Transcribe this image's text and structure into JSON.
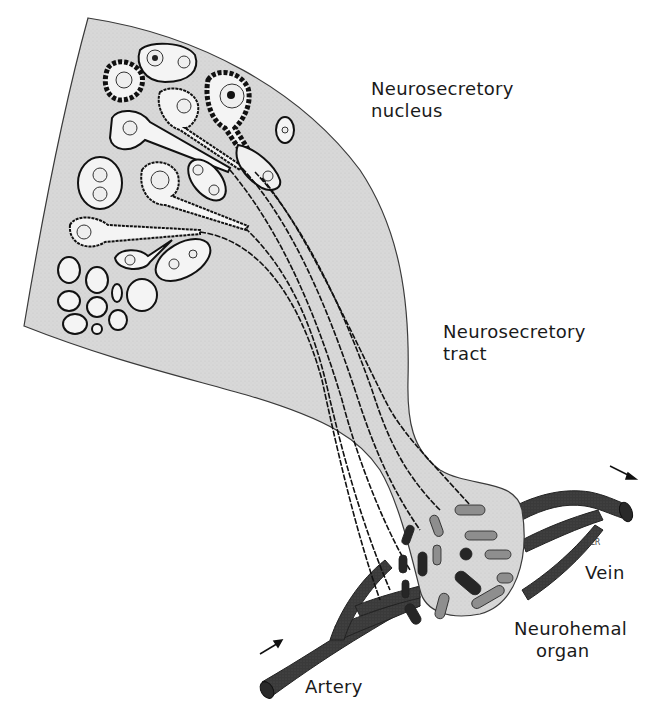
{
  "figure": {
    "labels": {
      "nucleus": [
        "Neurosecretory",
        "nucleus"
      ],
      "tract": [
        "Neurosecretory",
        "tract"
      ],
      "vein": "Vein",
      "organ": [
        "Neurohemal",
        "organ"
      ],
      "artery": "Artery"
    },
    "signature": "JLR",
    "colors": {
      "tissue_fill": "#d6d6d6",
      "tissue_outline": "#3a3a3a",
      "cell_fill": "#f4f4f4",
      "cell_outline": "#111111",
      "vessel": "#3b3b3b",
      "granule_dark": "#262626",
      "granule_light": "#8e8e8e",
      "text": "#1a1a1a"
    },
    "flow_arrows": [
      "artery-inflow",
      "vein-outflow"
    ]
  }
}
